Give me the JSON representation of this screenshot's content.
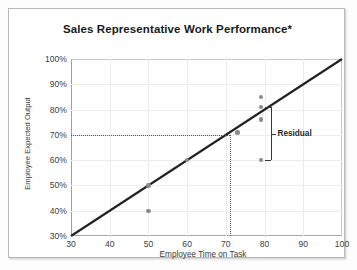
{
  "chart_data": {
    "type": "scatter",
    "title": "Sales Representative Work Performance*",
    "xlabel": "Employee Time on Task",
    "ylabel": "Employee Expected Output",
    "xlim": [
      30,
      100
    ],
    "ylim": [
      30,
      100
    ],
    "grid": true,
    "legend": null,
    "xticks": [
      "30",
      "40",
      "50",
      "60",
      "70",
      "80",
      "90",
      "100"
    ],
    "xtick_values": [
      30,
      40,
      50,
      60,
      70,
      80,
      90,
      100
    ],
    "yticks": [
      "30%",
      "40%",
      "50%",
      "60%",
      "70%",
      "80%",
      "90%",
      "100%"
    ],
    "ytick_values": [
      30,
      40,
      50,
      60,
      70,
      80,
      90,
      100
    ],
    "points": [
      {
        "x": 50,
        "y": 40
      },
      {
        "x": 50,
        "y": 50
      },
      {
        "x": 60,
        "y": 60
      },
      {
        "x": 73,
        "y": 71
      },
      {
        "x": 79,
        "y": 85
      },
      {
        "x": 79,
        "y": 81
      },
      {
        "x": 79,
        "y": 76
      },
      {
        "x": 79,
        "y": 60
      }
    ],
    "trendline": {
      "x0": 30,
      "y0": 30,
      "x1": 100,
      "y1": 100
    },
    "reference_lines": {
      "horizontal_y": 70,
      "vertical_x": 71
    },
    "annotations": [
      {
        "label": "Residual",
        "at_x": 80,
        "from_y": 81,
        "to_y": 60
      }
    ],
    "series": [
      {
        "name": "Observed employees",
        "values": [
          40,
          50,
          60,
          71,
          85,
          81,
          76,
          60
        ]
      }
    ],
    "colors": {
      "point": "#8a8a8a",
      "trendline": "#222222",
      "grid": "#ececec",
      "axis": "#a0a0a0",
      "annotation": "#1f1f1f"
    }
  }
}
